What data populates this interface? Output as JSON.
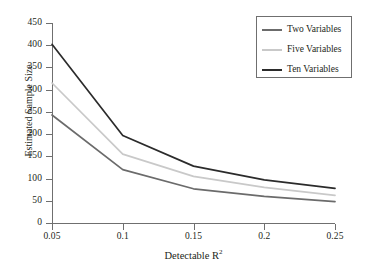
{
  "chart_data": {
    "type": "line",
    "title": "",
    "xlabel": "Detectable R²",
    "xlabel_base": "Detectable R",
    "xlabel_sup": "2",
    "ylabel": "Estimated Sample Size",
    "x": [
      0.05,
      0.1,
      0.15,
      0.2,
      0.25
    ],
    "xtick_labels": [
      "0.05",
      "0.1",
      "0.15",
      "0.2",
      "0.25"
    ],
    "ytick_labels": [
      "0",
      "50",
      "100",
      "150",
      "200",
      "250",
      "300",
      "350",
      "400",
      "450"
    ],
    "ytick_values": [
      0,
      50,
      100,
      150,
      200,
      250,
      300,
      350,
      400,
      450
    ],
    "xlim": [
      0.05,
      0.25
    ],
    "ylim": [
      0,
      450
    ],
    "grid": false,
    "legend_position": "top-right",
    "series": [
      {
        "name": "Two Variables",
        "color": "#6b6b6b",
        "values": [
          243,
          120,
          77,
          60,
          48
        ]
      },
      {
        "name": "Five Variables",
        "color": "#c9c9c9",
        "values": [
          315,
          155,
          105,
          80,
          62
        ]
      },
      {
        "name": "Ten Variables",
        "color": "#2b2b2b",
        "values": [
          402,
          197,
          128,
          97,
          78
        ]
      }
    ]
  },
  "legend": {
    "items": [
      {
        "label": "Two Variables"
      },
      {
        "label": "Five Variables"
      },
      {
        "label": "Ten Variables"
      }
    ]
  },
  "colors": {
    "axis": "#6f6f6f",
    "text": "#231f20",
    "background": "#ffffff"
  }
}
